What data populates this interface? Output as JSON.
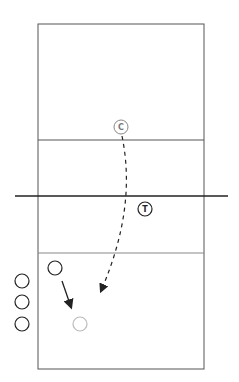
{
  "diagram": {
    "type": "volleyball-drill",
    "colors": {
      "court_line": "#555555",
      "net": "#222222",
      "player": "#222222",
      "target": "#bbbbbb",
      "coach": "#888888"
    },
    "markers": {
      "coach": {
        "label": "C"
      },
      "target": {
        "label": "T"
      }
    },
    "players": [
      {
        "role": "waiting-player-1"
      },
      {
        "role": "waiting-player-2"
      },
      {
        "role": "waiting-player-3"
      },
      {
        "role": "active-player"
      }
    ],
    "arrows": [
      {
        "from": "coach",
        "to": "landing-spot",
        "style": "dashed",
        "meaning": "ball path"
      },
      {
        "from": "active-player",
        "to": "target-spot",
        "style": "solid",
        "meaning": "player movement"
      }
    ]
  }
}
